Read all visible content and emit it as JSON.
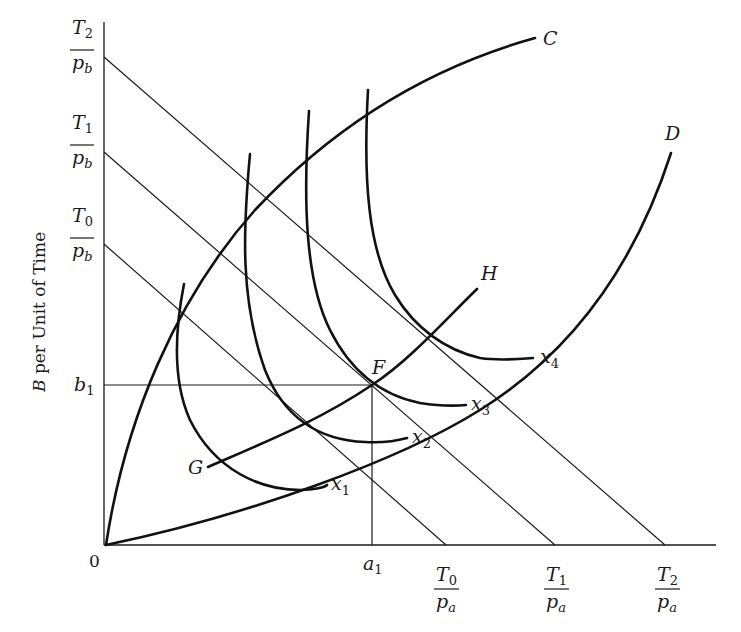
{
  "figure": {
    "ylabel": "B per Unit of Time",
    "ylabel_var": "B",
    "ylabel_rest": " per Unit of Time",
    "origin_label": "0",
    "y_ticks": [
      {
        "num": "T",
        "num_sub": "2",
        "den": "p",
        "den_sub": "b"
      },
      {
        "num": "T",
        "num_sub": "1",
        "den": "p",
        "den_sub": "b"
      },
      {
        "num": "T",
        "num_sub": "0",
        "den": "p",
        "den_sub": "b"
      }
    ],
    "x_ticks": [
      {
        "num": "T",
        "num_sub": "0",
        "den": "p",
        "den_sub": "a"
      },
      {
        "num": "T",
        "num_sub": "1",
        "den": "p",
        "den_sub": "a"
      },
      {
        "num": "T",
        "num_sub": "2",
        "den": "p",
        "den_sub": "a"
      }
    ],
    "b1": {
      "var": "b",
      "sub": "1"
    },
    "a1": {
      "var": "a",
      "sub": "1"
    },
    "curve_labels": {
      "C": "C",
      "D": "D",
      "G": "G",
      "H": "H",
      "F": "F"
    },
    "isoquants": [
      {
        "var": "x",
        "sub": "1"
      },
      {
        "var": "x",
        "sub": "2"
      },
      {
        "var": "x",
        "sub": "3"
      },
      {
        "var": "x",
        "sub": "4"
      }
    ]
  }
}
